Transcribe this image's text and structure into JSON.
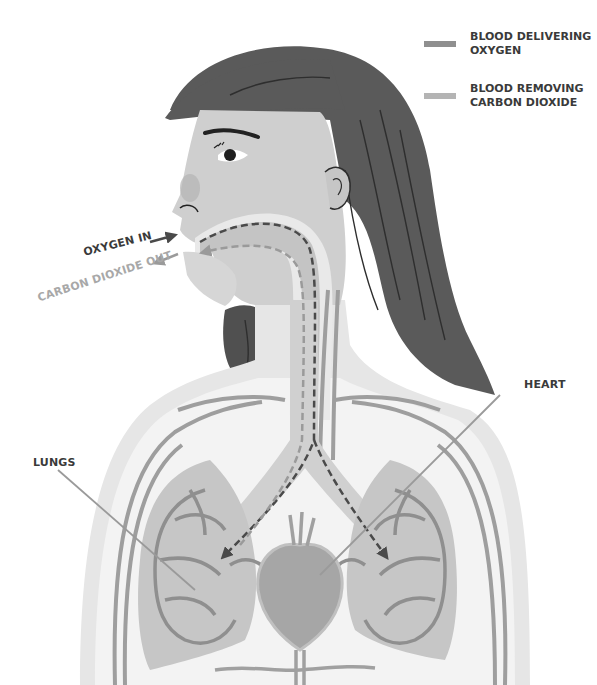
{
  "legend": {
    "items": [
      {
        "label_line1": "BLOOD DELIVERING",
        "label_line2": "OXYGEN",
        "color": "#8f8f8f"
      },
      {
        "label_line1": "BLOOD REMOVING",
        "label_line2": "CARBON DIOXIDE",
        "color": "#b4b4b4"
      }
    ]
  },
  "labels": {
    "oxygen_in": "OXYGEN IN",
    "carbon_dioxide_out": "CARBON DIOXIDE OUT",
    "lungs": "LUNGS",
    "heart": "HEART"
  },
  "colors": {
    "hair": "#5a5a5a",
    "skin": "#cfcfcf",
    "airway": "#bfbfbf",
    "lung_fill": "#c6c6c6",
    "lung_vessel": "#8f8f8f",
    "heart": "#a6a6a6",
    "oxygen_path": "#4a4a4a",
    "co2_path": "#9a9a9a",
    "label_dark": "#3a3a3a",
    "label_light": "#a8a8a8"
  }
}
